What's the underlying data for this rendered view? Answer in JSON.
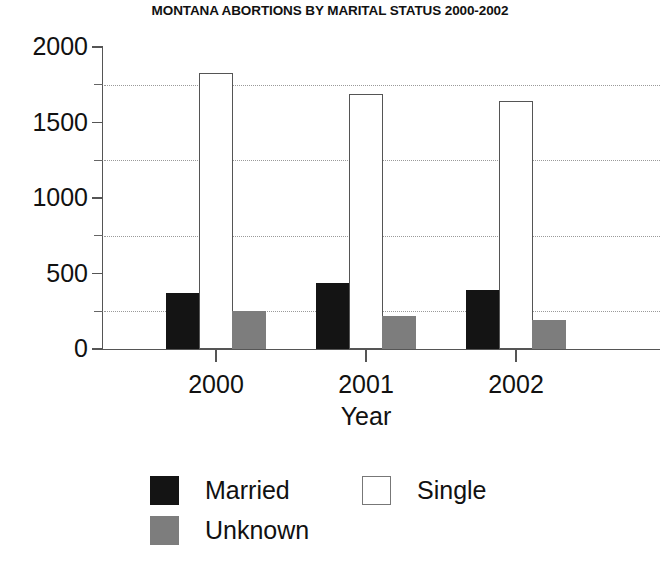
{
  "chart_data": {
    "type": "bar",
    "title": "MONTANA ABORTIONS BY MARITAL STATUS 2000-2002",
    "xlabel": "Year",
    "ylabel": "",
    "categories": [
      "2000",
      "2001",
      "2002"
    ],
    "series": [
      {
        "name": "Married",
        "color": "#141414",
        "values": [
          370,
          435,
          390
        ]
      },
      {
        "name": "Single",
        "color": "#ffffff",
        "values": [
          1825,
          1690,
          1640
        ]
      },
      {
        "name": "Unknown",
        "color": "#7d7d7d",
        "values": [
          250,
          220,
          195
        ]
      }
    ],
    "series_order_in_group": [
      "Married",
      "Single",
      "Unknown"
    ],
    "ylim": [
      0,
      2000
    ],
    "ytick_labels": [
      "0",
      "500",
      "1000",
      "1500",
      "2000"
    ],
    "ytick_values": [
      0,
      500,
      1000,
      1500,
      2000
    ],
    "yminor_values": [
      250,
      750,
      1250,
      1750
    ],
    "gridline_values": [
      250,
      750,
      1250,
      1750
    ],
    "grid": "dotted-horizontal-at-minor-ticks",
    "legend_position": "below-plot",
    "legend_entries": [
      {
        "label": "Married",
        "swatch": "solid-black"
      },
      {
        "label": "Single",
        "swatch": "outlined-white"
      },
      {
        "label": "Unknown",
        "swatch": "solid-gray"
      }
    ],
    "axis_color": "#555555",
    "grid_color": "#9a9a9a",
    "background": "#ffffff"
  }
}
